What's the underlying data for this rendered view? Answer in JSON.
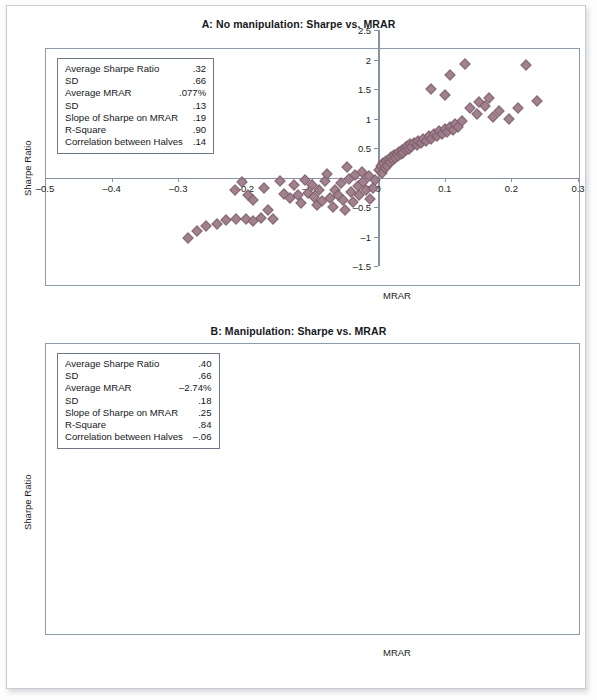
{
  "page": {
    "figure_type": "two-panel-scatter"
  },
  "panels": [
    {
      "id": "A",
      "title": "A: No manipulation: Sharpe vs. MRAR",
      "xlabel": "MRAR",
      "ylabel": "Sharpe Ratio",
      "xticks": [
        "–0.5",
        "–0.4",
        "–0.3",
        "–0.2",
        "–0.1",
        "0",
        "0.1",
        "0.2",
        "0.3"
      ],
      "yticks": [
        "2.5",
        "2",
        "1.5",
        "1",
        "0.5",
        "0",
        "–0.5",
        "–1",
        "–1.5"
      ],
      "stats": [
        {
          "label": "Average Sharpe Ratio",
          "value": ".32"
        },
        {
          "label": "SD",
          "value": ".66"
        },
        {
          "label": "Average MRAR",
          "value": ".077%"
        },
        {
          "label": "SD",
          "value": ".13"
        },
        {
          "label": "Slope of Sharpe on MRAR",
          "value": ".19"
        },
        {
          "label": "R-Square",
          "value": ".90"
        },
        {
          "label": "Correlation between Halves",
          "value": ".14"
        }
      ]
    },
    {
      "id": "B",
      "title": "B: Manipulation: Sharpe vs. MRAR",
      "xlabel": "MRAR",
      "ylabel": "Sharpe Ratio",
      "xticks": [
        "–0.5",
        "–0.4",
        "–0.3",
        "–0.2",
        "–0.1",
        "0",
        "0.1",
        "0.2",
        "0.3",
        "0.4"
      ],
      "yticks": [
        "3",
        "2.5",
        "2",
        "1.5",
        "1",
        "0.5",
        "0",
        "–0.5",
        "–1",
        "–1.5"
      ],
      "stats": [
        {
          "label": "Average Sharpe Ratio",
          "value": ".40"
        },
        {
          "label": "SD",
          "value": ".66"
        },
        {
          "label": "Average MRAR",
          "value": "–2.74%"
        },
        {
          "label": "SD",
          "value": ".18"
        },
        {
          "label": "Slope of Sharpe on MRAR",
          "value": ".25"
        },
        {
          "label": "R-Square",
          "value": ".84"
        },
        {
          "label": "Correlation between Halves",
          "value": "–.06"
        }
      ]
    }
  ],
  "colors": {
    "marker_fill": "#9d7b88",
    "marker_edge": "#7e5f6c",
    "axis": "#8791a3",
    "frame": "#8e99ab",
    "text": "#16181d"
  },
  "chart_data": [
    {
      "type": "scatter",
      "panel": "A",
      "title": "A: No manipulation: Sharpe vs. MRAR",
      "xlabel": "MRAR",
      "ylabel": "Sharpe Ratio",
      "xlim": [
        -0.5,
        0.3
      ],
      "ylim": [
        -1.5,
        2.5
      ],
      "xticks": [
        -0.5,
        -0.4,
        -0.3,
        -0.2,
        -0.1,
        0,
        0.1,
        0.2,
        0.3
      ],
      "yticks": [
        -1.5,
        -1,
        -0.5,
        0,
        0.5,
        1,
        1.5,
        2,
        2.5
      ],
      "grid": false,
      "legend": false,
      "marker": "diamond",
      "points": [
        [
          -0.285,
          -1.02
        ],
        [
          -0.272,
          -0.9
        ],
        [
          -0.258,
          -0.83
        ],
        [
          -0.242,
          -0.78
        ],
        [
          -0.228,
          -0.72
        ],
        [
          -0.213,
          -0.7
        ],
        [
          -0.198,
          -0.71
        ],
        [
          -0.188,
          -0.73
        ],
        [
          -0.176,
          -0.68
        ],
        [
          -0.215,
          -0.22
        ],
        [
          -0.204,
          -0.08
        ],
        [
          -0.196,
          -0.3
        ],
        [
          -0.188,
          -0.38
        ],
        [
          -0.172,
          -0.18
        ],
        [
          -0.166,
          -0.55
        ],
        [
          -0.158,
          -0.7
        ],
        [
          -0.148,
          -0.06
        ],
        [
          -0.142,
          -0.28
        ],
        [
          -0.133,
          -0.35
        ],
        [
          -0.127,
          -0.12
        ],
        [
          -0.12,
          -0.3
        ],
        [
          -0.116,
          -0.44
        ],
        [
          -0.11,
          -0.04
        ],
        [
          -0.106,
          -0.26
        ],
        [
          -0.1,
          -0.12
        ],
        [
          -0.096,
          -0.33
        ],
        [
          -0.092,
          -0.46
        ],
        [
          -0.088,
          -0.21
        ],
        [
          -0.084,
          -0.4
        ],
        [
          -0.08,
          -0.06
        ],
        [
          -0.076,
          0.06
        ],
        [
          -0.072,
          -0.35
        ],
        [
          -0.068,
          -0.5
        ],
        [
          -0.064,
          -0.22
        ],
        [
          -0.06,
          -0.3
        ],
        [
          -0.056,
          -0.1
        ],
        [
          -0.052,
          -0.38
        ],
        [
          -0.05,
          -0.55
        ],
        [
          -0.046,
          0.18
        ],
        [
          -0.044,
          -0.02
        ],
        [
          -0.04,
          -0.25
        ],
        [
          -0.038,
          -0.42
        ],
        [
          -0.034,
          0.04
        ],
        [
          -0.03,
          -0.15
        ],
        [
          -0.028,
          -0.3
        ],
        [
          -0.024,
          0.1
        ],
        [
          -0.022,
          -0.08
        ],
        [
          -0.018,
          -0.22
        ],
        [
          -0.014,
          0.02
        ],
        [
          -0.012,
          -0.36
        ],
        [
          -0.008,
          -0.18
        ],
        [
          -0.004,
          -0.05
        ],
        [
          0.002,
          0.12
        ],
        [
          0.004,
          0.2
        ],
        [
          0.006,
          0.08
        ],
        [
          0.008,
          0.24
        ],
        [
          0.01,
          0.16
        ],
        [
          0.012,
          0.28
        ],
        [
          0.014,
          0.2
        ],
        [
          0.016,
          0.3
        ],
        [
          0.018,
          0.26
        ],
        [
          0.02,
          0.34
        ],
        [
          0.022,
          0.3
        ],
        [
          0.024,
          0.38
        ],
        [
          0.026,
          0.33
        ],
        [
          0.028,
          0.4
        ],
        [
          0.03,
          0.36
        ],
        [
          0.032,
          0.44
        ],
        [
          0.034,
          0.4
        ],
        [
          0.036,
          0.47
        ],
        [
          0.038,
          0.42
        ],
        [
          0.04,
          0.5
        ],
        [
          0.042,
          0.46
        ],
        [
          0.044,
          0.53
        ],
        [
          0.046,
          0.48
        ],
        [
          0.048,
          0.56
        ],
        [
          0.05,
          0.51
        ],
        [
          0.054,
          0.58
        ],
        [
          0.058,
          0.55
        ],
        [
          0.06,
          0.62
        ],
        [
          0.064,
          0.58
        ],
        [
          0.068,
          0.66
        ],
        [
          0.072,
          0.62
        ],
        [
          0.076,
          0.7
        ],
        [
          0.08,
          0.66
        ],
        [
          0.084,
          0.74
        ],
        [
          0.088,
          0.7
        ],
        [
          0.092,
          0.78
        ],
        [
          0.096,
          0.73
        ],
        [
          0.1,
          0.82
        ],
        [
          0.104,
          0.77
        ],
        [
          0.108,
          0.86
        ],
        [
          0.112,
          0.8
        ],
        [
          0.116,
          0.9
        ],
        [
          0.12,
          0.85
        ],
        [
          0.126,
          0.96
        ],
        [
          0.08,
          1.5
        ],
        [
          0.1,
          1.4
        ],
        [
          0.108,
          1.74
        ],
        [
          0.13,
          1.92
        ],
        [
          0.138,
          1.18
        ],
        [
          0.148,
          1.08
        ],
        [
          0.152,
          1.28
        ],
        [
          0.16,
          1.22
        ],
        [
          0.166,
          1.35
        ],
        [
          0.172,
          1.02
        ],
        [
          0.182,
          1.12
        ],
        [
          0.196,
          1.0
        ],
        [
          0.21,
          1.18
        ],
        [
          0.222,
          1.9
        ],
        [
          0.238,
          1.3
        ]
      ]
    },
    {
      "type": "scatter",
      "panel": "B",
      "title": "B: Manipulation: Sharpe vs. MRAR",
      "xlabel": "MRAR",
      "ylabel": "Sharpe Ratio",
      "xlim": [
        -0.5,
        0.4
      ],
      "ylim": [
        -1.5,
        3.0
      ],
      "xticks": [
        -0.5,
        -0.4,
        -0.3,
        -0.2,
        -0.1,
        0,
        0.1,
        0.2,
        0.3,
        0.4
      ],
      "yticks": [
        -1.5,
        -1,
        -0.5,
        0,
        0.5,
        1,
        1.5,
        2,
        2.5,
        3
      ],
      "grid": false,
      "legend": false,
      "marker": "diamond",
      "points": [
        [
          -0.452,
          -0.7
        ],
        [
          -0.436,
          -0.78
        ],
        [
          -0.43,
          -0.8
        ],
        [
          -0.424,
          -0.74
        ],
        [
          -0.412,
          -0.72
        ],
        [
          -0.406,
          -0.66
        ],
        [
          -0.354,
          -0.52
        ],
        [
          -0.348,
          -0.56
        ],
        [
          -0.344,
          -0.5
        ],
        [
          -0.336,
          0.22
        ],
        [
          -0.316,
          -0.1
        ],
        [
          -0.312,
          -0.12
        ],
        [
          -0.3,
          -0.12
        ],
        [
          -0.296,
          -0.3
        ],
        [
          -0.288,
          -0.22
        ],
        [
          -0.284,
          -0.26
        ],
        [
          -0.274,
          0.22
        ],
        [
          -0.262,
          -0.36
        ],
        [
          -0.252,
          -0.1
        ],
        [
          -0.246,
          -0.12
        ],
        [
          -0.24,
          -0.52
        ],
        [
          -0.232,
          -0.28
        ],
        [
          -0.228,
          -0.4
        ],
        [
          -0.22,
          -0.66
        ],
        [
          -0.214,
          -0.1
        ],
        [
          -0.208,
          -0.3
        ],
        [
          -0.2,
          0.2
        ],
        [
          -0.196,
          0.22
        ],
        [
          -0.192,
          -0.08
        ],
        [
          -0.186,
          -0.26
        ],
        [
          -0.18,
          -0.36
        ],
        [
          -0.172,
          -0.12
        ],
        [
          -0.166,
          -0.58
        ],
        [
          -0.16,
          -0.3
        ],
        [
          -0.152,
          -0.44
        ],
        [
          -0.146,
          -0.34
        ],
        [
          -0.14,
          -0.18
        ],
        [
          -0.134,
          -0.02
        ],
        [
          -0.128,
          -0.4
        ],
        [
          -0.12,
          -0.3
        ],
        [
          -0.114,
          -0.38
        ],
        [
          -0.106,
          0.6
        ],
        [
          -0.1,
          -0.34
        ],
        [
          -0.094,
          -0.06
        ],
        [
          -0.086,
          -0.02
        ],
        [
          -0.08,
          0.02
        ],
        [
          -0.076,
          0.04
        ],
        [
          -0.072,
          0.0
        ],
        [
          -0.068,
          -0.04
        ],
        [
          -0.064,
          0.02
        ],
        [
          -0.06,
          -0.2
        ],
        [
          -0.056,
          -0.3
        ],
        [
          -0.05,
          0.06
        ],
        [
          -0.044,
          -0.42
        ],
        [
          -0.04,
          -0.06
        ],
        [
          -0.034,
          0.24
        ],
        [
          -0.03,
          0.18
        ],
        [
          -0.026,
          0.22
        ],
        [
          -0.022,
          0.16
        ],
        [
          -0.018,
          0.2
        ],
        [
          -0.014,
          0.14
        ],
        [
          -0.01,
          0.18
        ],
        [
          -0.008,
          0.06
        ],
        [
          -0.006,
          0.24
        ],
        [
          0.004,
          0.3
        ],
        [
          0.01,
          0.34
        ],
        [
          0.014,
          0.36
        ],
        [
          0.018,
          0.35
        ],
        [
          0.022,
          0.38
        ],
        [
          0.026,
          0.4
        ],
        [
          0.03,
          0.42
        ],
        [
          0.034,
          0.41
        ],
        [
          0.038,
          0.44
        ],
        [
          0.042,
          0.46
        ],
        [
          0.046,
          0.48
        ],
        [
          0.05,
          0.5
        ],
        [
          0.054,
          0.52
        ],
        [
          0.058,
          0.54
        ],
        [
          0.062,
          0.56
        ],
        [
          0.064,
          0.64
        ],
        [
          0.066,
          0.7
        ],
        [
          0.068,
          0.6
        ],
        [
          0.07,
          0.72
        ],
        [
          0.072,
          0.66
        ],
        [
          0.074,
          0.74
        ],
        [
          0.076,
          0.68
        ],
        [
          0.078,
          0.76
        ],
        [
          0.08,
          0.7
        ],
        [
          0.082,
          0.78
        ],
        [
          0.084,
          0.72
        ],
        [
          0.086,
          0.8
        ],
        [
          0.088,
          0.74
        ],
        [
          0.09,
          0.82
        ],
        [
          0.092,
          0.68
        ],
        [
          0.094,
          0.76
        ],
        [
          0.096,
          0.84
        ],
        [
          0.098,
          0.7
        ],
        [
          0.1,
          0.78
        ],
        [
          0.104,
          0.86
        ],
        [
          0.108,
          0.74
        ],
        [
          0.112,
          0.82
        ],
        [
          0.116,
          0.9
        ],
        [
          0.12,
          0.78
        ],
        [
          0.124,
          0.86
        ],
        [
          0.128,
          0.94
        ],
        [
          0.132,
          0.82
        ],
        [
          0.136,
          0.9
        ],
        [
          0.14,
          0.98
        ],
        [
          0.134,
          1.2
        ],
        [
          0.148,
          0.92
        ],
        [
          0.152,
          1.0
        ],
        [
          0.158,
          0.96
        ],
        [
          0.164,
          1.04
        ],
        [
          0.17,
          1.1
        ],
        [
          0.176,
          1.0
        ],
        [
          0.18,
          1.08
        ],
        [
          0.186,
          1.16
        ],
        [
          0.192,
          1.06
        ],
        [
          0.196,
          1.22
        ],
        [
          0.204,
          1.12
        ],
        [
          0.172,
          1.48
        ],
        [
          0.196,
          1.72
        ],
        [
          0.21,
          1.2
        ],
        [
          0.306,
          2.48
        ],
        [
          0.342,
          1.68
        ]
      ]
    }
  ]
}
